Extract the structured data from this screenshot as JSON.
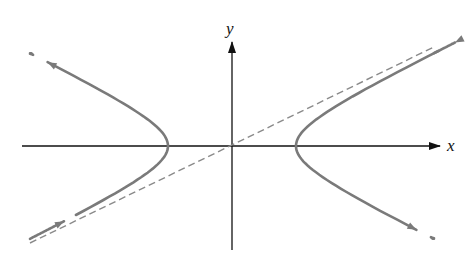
{
  "diagram": {
    "title": "",
    "axes": {
      "x_label": "x",
      "y_label": "y"
    },
    "curve": "hyperbola x^2/a^2 - y^2/b^2 = 1 with trajectory arrows",
    "asymptote_style": "dashed",
    "colors": {
      "axes": "#111111",
      "curve": "#7a7a7a",
      "asymptote": "#8a8a8a"
    },
    "geometry": {
      "origin_px": [
        232,
        146
      ],
      "a_px": 64,
      "b_px": 31
    }
  }
}
